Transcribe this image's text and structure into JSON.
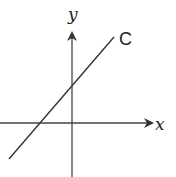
{
  "diagram": {
    "type": "coordinate-axes-with-line",
    "x_axis_label": "x",
    "y_axis_label": "y",
    "curve_label": "C",
    "colors": {
      "stroke": "#333333",
      "background": "#ffffff"
    }
  }
}
